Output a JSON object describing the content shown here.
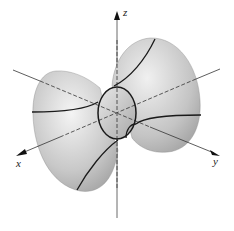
{
  "figure": {
    "type": "3d-surface",
    "axes": {
      "x_label": "x",
      "y_label": "y",
      "z_label": "z"
    },
    "colors": {
      "surface_light": "#f2f2f2",
      "surface_dark": "#9a9a9a",
      "trace_lines": "#1a1a1a",
      "axes": "#333333"
    }
  }
}
